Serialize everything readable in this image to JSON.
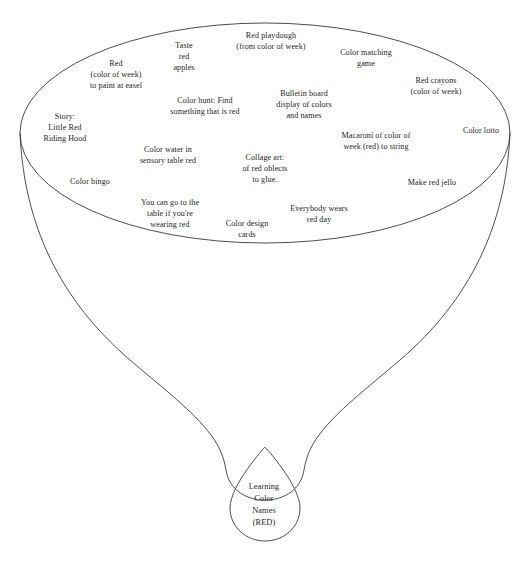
{
  "diagram": {
    "type": "funnel-brainstorm",
    "title_visible": false,
    "shape_names": {
      "funnel": "funnel-outline",
      "bowl_rim": "funnel-rim-ellipse",
      "droplet": "outcome-droplet"
    },
    "colors": {
      "stroke": "#3a3a3c",
      "background": "#ffffff",
      "text": "#1d1d1f"
    }
  },
  "activities": [
    {
      "id": "red-paint-easel",
      "text": "Red\n(color of week)\nto paint at easel",
      "x": 116,
      "y": 75
    },
    {
      "id": "taste-red-apples",
      "text": "Taste\nred\napples",
      "x": 184,
      "y": 57
    },
    {
      "id": "red-playdough",
      "text": "Red playdough\n(from color of week)",
      "x": 271,
      "y": 42
    },
    {
      "id": "color-matching-game",
      "text": "Color matching\ngame",
      "x": 366,
      "y": 59
    },
    {
      "id": "red-crayons",
      "text": "Red crayons\n(color of week)",
      "x": 436,
      "y": 87
    },
    {
      "id": "bulletin-board",
      "text": "Bulletin board\ndisplay of colors\nand names",
      "x": 304,
      "y": 105
    },
    {
      "id": "color-hunt",
      "text": "Color hunt: Find\nsomething that is red",
      "x": 205,
      "y": 107
    },
    {
      "id": "story-little-red",
      "text": "Story:\nLittle Red\nRiding Hood",
      "x": 65,
      "y": 128
    },
    {
      "id": "color-lotto",
      "text": "Color lotto",
      "x": 481,
      "y": 131
    },
    {
      "id": "macaroni-string",
      "text": "Macaroni of color of\nweek (red) to string",
      "x": 376,
      "y": 142
    },
    {
      "id": "color-water-sensory",
      "text": "Color water in\nsensory table red",
      "x": 168,
      "y": 156
    },
    {
      "id": "collage-art",
      "text": "Collage art:\nof red oblects\nto glue.",
      "x": 265,
      "y": 169
    },
    {
      "id": "color-bingo",
      "text": "Color bingo",
      "x": 90,
      "y": 182
    },
    {
      "id": "make-red-jello",
      "text": "Make red jello",
      "x": 432,
      "y": 183
    },
    {
      "id": "wearing-red-table",
      "text": "You can go to the\ntable if you're\nwearing red",
      "x": 170,
      "y": 214
    },
    {
      "id": "everybody-wears-red",
      "text": "Everybody wears\nred day",
      "x": 319,
      "y": 215
    },
    {
      "id": "color-design-cards",
      "text": "Color design\ncards",
      "x": 247,
      "y": 230
    }
  ],
  "outcome": {
    "id": "learning-color-names",
    "text": "Learning\nColor\nNames\n(RED)",
    "x": 264,
    "y": 505
  }
}
